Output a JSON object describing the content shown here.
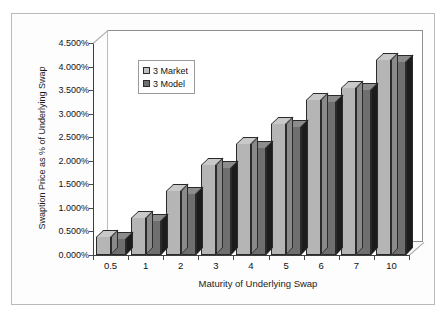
{
  "chart_data": {
    "type": "bar",
    "title": "",
    "xlabel": "Maturity of Underlying Swap",
    "ylabel": "Swaption Price as % of Underlying Swap",
    "categories": [
      "0.5",
      "1",
      "2",
      "3",
      "4",
      "5",
      "6",
      "7",
      "10"
    ],
    "series": [
      {
        "name": "3 Market",
        "color": "#b5b5b5",
        "values": [
          0.38,
          0.78,
          1.35,
          1.92,
          2.35,
          2.78,
          3.3,
          3.55,
          4.15
        ]
      },
      {
        "name": "3 Model",
        "color": "#6f6f6f",
        "values": [
          0.35,
          0.72,
          1.3,
          1.85,
          2.28,
          2.72,
          3.25,
          3.5,
          4.1
        ]
      }
    ],
    "ylim": [
      0,
      4.5
    ],
    "ytick_values": [
      0,
      0.5,
      1.0,
      1.5,
      2.0,
      2.5,
      3.0,
      3.5,
      4.0,
      4.5
    ],
    "ytick_labels": [
      "0.000%",
      "0.500%",
      "1.000%",
      "1.500%",
      "2.000%",
      "2.500%",
      "3.000%",
      "3.500%",
      "4.000%",
      "4.500%"
    ],
    "units": "percent",
    "grid": false,
    "legend_position": "top-left-inside",
    "style": "3d-clustered-column"
  },
  "legend": {
    "entries": [
      {
        "label": "3 Market",
        "swatch": "market"
      },
      {
        "label": "3 Model",
        "swatch": "model"
      }
    ]
  },
  "axes": {
    "y_title": "Swaption Price as % of Underlying Swap",
    "x_title": "Maturity of Underlying Swap"
  }
}
